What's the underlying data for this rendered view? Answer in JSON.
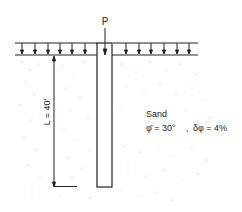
{
  "diagram": {
    "type": "pile-in-sand",
    "load_label": "P",
    "length_label": "L = 40'",
    "soil": {
      "name": "Sand",
      "phi_label": "φ̄ = 30°",
      "separator": ",",
      "delta_label": "δφ = 4%"
    },
    "colors": {
      "line": "#222222",
      "stipple": "#9a9a9a",
      "background": "#ffffff"
    }
  }
}
